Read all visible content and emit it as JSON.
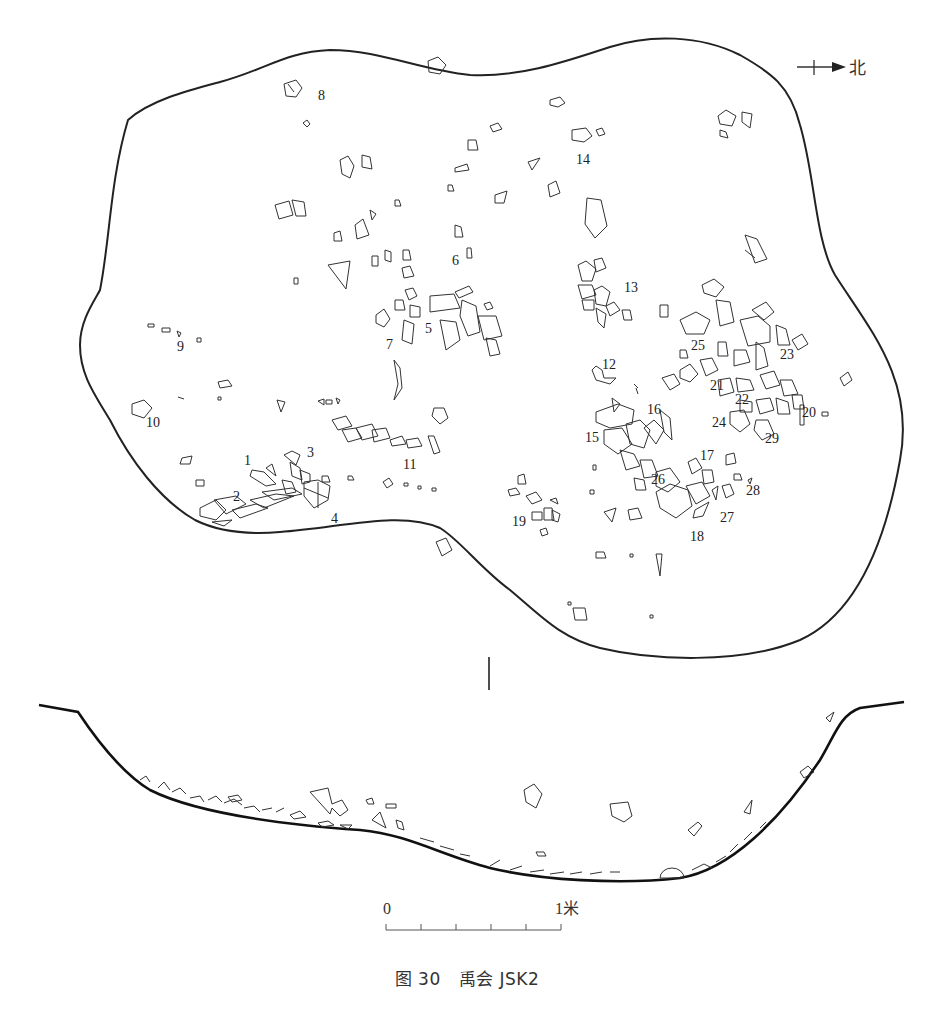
{
  "figure": {
    "caption": {
      "label": "图 30",
      "title": "禹会 JSK2"
    },
    "north_arrow": {
      "label": "北",
      "icon": "north-arrow-icon"
    },
    "scale_bar": {
      "start_label": "0",
      "end_label": "1米",
      "divisions": 5
    },
    "plan_view": {
      "artifact_labels": [
        {
          "id": "1",
          "x": 246,
          "y": 465
        },
        {
          "id": "2",
          "x": 233,
          "y": 500
        },
        {
          "id": "3",
          "x": 308,
          "y": 456
        },
        {
          "id": "4",
          "x": 331,
          "y": 522
        },
        {
          "id": "5",
          "x": 424,
          "y": 333
        },
        {
          "id": "6",
          "x": 452,
          "y": 264
        },
        {
          "id": "7",
          "x": 385,
          "y": 348
        },
        {
          "id": "8",
          "x": 318,
          "y": 100
        },
        {
          "id": "9",
          "x": 178,
          "y": 351
        },
        {
          "id": "10",
          "x": 146,
          "y": 426
        },
        {
          "id": "11",
          "x": 404,
          "y": 468
        },
        {
          "id": "12",
          "x": 602,
          "y": 368
        },
        {
          "id": "13",
          "x": 624,
          "y": 291
        },
        {
          "id": "14",
          "x": 576,
          "y": 163
        },
        {
          "id": "15",
          "x": 586,
          "y": 441
        },
        {
          "id": "16",
          "x": 647,
          "y": 414
        },
        {
          "id": "17",
          "x": 700,
          "y": 459
        },
        {
          "id": "18",
          "x": 690,
          "y": 540
        },
        {
          "id": "19",
          "x": 512,
          "y": 526
        },
        {
          "id": "20",
          "x": 800,
          "y": 416
        },
        {
          "id": "21",
          "x": 711,
          "y": 389
        },
        {
          "id": "22",
          "x": 735,
          "y": 403
        },
        {
          "id": "23",
          "x": 779,
          "y": 359
        },
        {
          "id": "24",
          "x": 712,
          "y": 426
        },
        {
          "id": "25",
          "x": 692,
          "y": 350
        },
        {
          "id": "26",
          "x": 652,
          "y": 484
        },
        {
          "id": "27",
          "x": 720,
          "y": 521
        },
        {
          "id": "28",
          "x": 746,
          "y": 494
        },
        {
          "id": "29",
          "x": 765,
          "y": 442
        }
      ]
    },
    "section_view": {
      "marker": "|"
    }
  }
}
